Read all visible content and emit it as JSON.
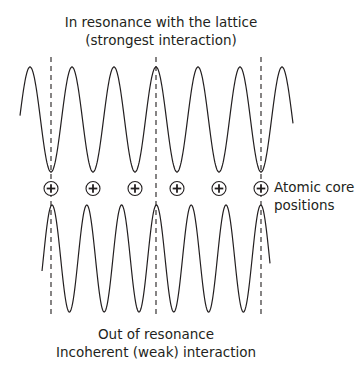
{
  "diagram": {
    "top_caption": {
      "line1": "In resonance with the lattice",
      "line2": "(strongest interaction)"
    },
    "bottom_caption": {
      "line1": "Out of resonance",
      "line2": "Incoherent (weak) interaction"
    },
    "side_label": {
      "line1": "Atomic core",
      "line2": "positions"
    },
    "atom_symbol": "+",
    "atom_count": 6,
    "upper_wave": {
      "description": "wavelength matches lattice spacing",
      "cycles": 6
    },
    "lower_wave": {
      "description": "wavelength shorter than lattice spacing",
      "cycles": 6
    },
    "reference_lines": 3,
    "colors": {
      "ink": "#231f20",
      "background": "#ffffff"
    }
  }
}
